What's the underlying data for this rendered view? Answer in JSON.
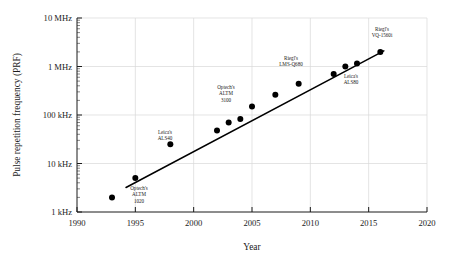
{
  "chart_data": {
    "type": "scatter",
    "title": "",
    "xlabel": "Year",
    "ylabel": "Pulse repetition frequency (PRF)",
    "xlim": [
      1990,
      2020
    ],
    "ylim": [
      1,
      10000
    ],
    "yscale": "log",
    "yunit": "kHz",
    "grid": true,
    "legend": "none",
    "xticks": [
      1990,
      1995,
      2000,
      2005,
      2010,
      2015,
      2020
    ],
    "xticklabels": [
      "1990",
      "1995",
      "2000",
      "2005",
      "2010",
      "2015",
      "2020"
    ],
    "yticks": [
      1,
      10,
      100,
      1000,
      10000
    ],
    "yticklabels": [
      "1 kHz",
      "10 kHz",
      "100 kHz",
      "1 MHz",
      "10 MHz"
    ],
    "x": [
      1993,
      1995,
      1998,
      2002,
      2003,
      2004,
      2005,
      2007,
      2009,
      2012,
      2013,
      2014,
      2016
    ],
    "values": [
      2,
      5,
      25,
      48,
      70,
      83,
      150,
      260,
      440,
      700,
      1000,
      1150,
      2000
    ],
    "points": [
      {
        "x": 1993,
        "y": 2,
        "label": ""
      },
      {
        "x": 1995,
        "y": 5,
        "label": "Optech's\nALTM\n1020"
      },
      {
        "x": 1998,
        "y": 25,
        "label": "Leica's\nALS40"
      },
      {
        "x": 2002,
        "y": 48,
        "label": ""
      },
      {
        "x": 2003,
        "y": 70,
        "label": ""
      },
      {
        "x": 2004,
        "y": 83,
        "label": "Optech's\nALTM\n3100"
      },
      {
        "x": 2005,
        "y": 150,
        "label": ""
      },
      {
        "x": 2007,
        "y": 260,
        "label": ""
      },
      {
        "x": 2009,
        "y": 440,
        "label": "Riegl's\nLMS-Q680"
      },
      {
        "x": 2012,
        "y": 700,
        "label": "Leica's\nALS80"
      },
      {
        "x": 2013,
        "y": 1000,
        "label": ""
      },
      {
        "x": 2014,
        "y": 1150,
        "label": ""
      },
      {
        "x": 2016,
        "y": 2000,
        "label": "Riegl's\nVQ-1560i"
      }
    ],
    "annotations": [
      {
        "name": "optech-altm-1020",
        "lines": [
          "Optech's",
          "ALTM",
          "1020"
        ],
        "x": 1995.1,
        "y": 2.6,
        "px": 139,
        "py": 190
      },
      {
        "name": "leica-als40",
        "lines": [
          "Leica's",
          "ALS40"
        ],
        "x": 1997.6,
        "y": 60,
        "px": 165,
        "py": 134
      },
      {
        "name": "optech-altm-3100",
        "lines": [
          "Optech's",
          "ALTM",
          "3100"
        ],
        "x": 2003.0,
        "y": 340,
        "px": 226,
        "py": 89
      },
      {
        "name": "riegl-lms-q680",
        "lines": [
          "Riegl's",
          "LMS-Q680"
        ],
        "x": 2008.2,
        "y": 1150,
        "px": 291,
        "py": 60
      },
      {
        "name": "leica-als80",
        "lines": [
          "Leica's",
          "ALS80"
        ],
        "x": 2013.2,
        "y": 620,
        "px": 351,
        "py": 78
      },
      {
        "name": "riegl-vq-1560i",
        "lines": [
          "Riegl's",
          "VQ-1560i"
        ],
        "x": 2015.6,
        "y": 4600,
        "px": 382,
        "py": 31
      }
    ],
    "trendline": {
      "x1": 1994.2,
      "y1": 3.2,
      "x2": 2016.3,
      "y2": 2100
    },
    "colors": {
      "marker": "#000000",
      "line": "#000000",
      "axis": "#1a1a1a",
      "grid": "#d8d8d8",
      "background": "#ffffff"
    }
  }
}
